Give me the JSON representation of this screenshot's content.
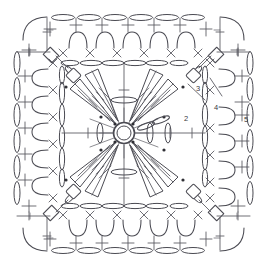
{
  "diagram": {
    "type": "crochet-pattern-chart",
    "canvas": {
      "width": 267,
      "height": 270,
      "background": "#ffffff"
    },
    "line_color": "#4a4a52",
    "accent_color": "#2f2f35",
    "center": {
      "x": 124,
      "y": 133
    },
    "row_labels": [
      {
        "id": "row-2",
        "text": "2",
        "x": 186,
        "y": 121
      },
      {
        "id": "row-3",
        "text": "3",
        "x": 198,
        "y": 91
      },
      {
        "id": "row-4",
        "text": "4",
        "x": 216,
        "y": 110
      },
      {
        "id": "row-5",
        "text": "5",
        "x": 246,
        "y": 122
      }
    ],
    "legend": {
      "ring": "magic-ring",
      "chain": "chain-stitch-oval",
      "single_crochet": "plus-symbol",
      "treble_cluster": "fan-cluster",
      "slip_stitch": "dot"
    },
    "rounds": [
      {
        "number": 1,
        "name": "magic ring center"
      },
      {
        "number": 2,
        "name": "fan clusters round"
      },
      {
        "number": 3,
        "name": "inner square chain round"
      },
      {
        "number": 4,
        "name": "corner and arch round"
      },
      {
        "number": 5,
        "name": "outer chain and single crochet border"
      }
    ],
    "counts": {
      "fans": 8,
      "top_arches": 5,
      "bottom_arches": 5,
      "left_arches": 5,
      "right_arches": 5,
      "corner_blocks": 4
    }
  }
}
